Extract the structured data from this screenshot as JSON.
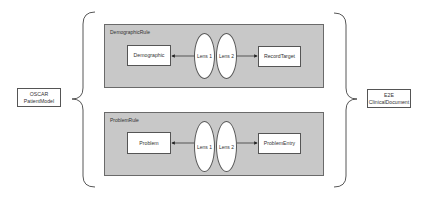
{
  "source": {
    "line1": "OSCAR",
    "line2": "PatientModel"
  },
  "target": {
    "line1": "E2E",
    "line2": "ClinicalDocument"
  },
  "rules": [
    {
      "title": "DemographicRule",
      "left_node": "Demographic",
      "lens1": "Lens 1",
      "lens2": "Lens 2",
      "right_node": "RecordTarget"
    },
    {
      "title": "ProblemRule",
      "left_node": "Problem",
      "lens1": "Lens 1",
      "lens2": "Lens 2",
      "right_node": "ProblemEntry"
    }
  ],
  "colors": {
    "rule_fill": "#c8c8c8",
    "stroke": "#555555"
  }
}
